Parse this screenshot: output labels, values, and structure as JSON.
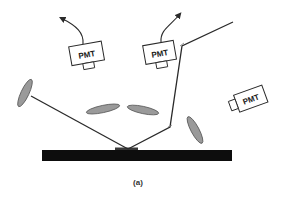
{
  "figure": {
    "label": "(a)",
    "colors": {
      "line": "#2a2a2a",
      "ellipse_fill": "#9a9a9a",
      "ellipse_stroke": "#5a5a5a",
      "base": "#0d0d0d",
      "background": "#ffffff"
    }
  },
  "detectors": [
    {
      "id": "pmt-1",
      "label": "PMT"
    },
    {
      "id": "pmt-2",
      "label": "PMT"
    },
    {
      "id": "pmt-3",
      "label": "PMT"
    }
  ]
}
